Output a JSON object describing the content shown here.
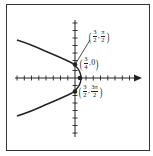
{
  "figure": {
    "equation_implied": "r = 3/(2 + 2cos θ)",
    "axes": {
      "horizontal_arrow": true,
      "tick_count_left": 8,
      "tick_count_right": 7,
      "tick_count_up": 6,
      "tick_count_down": 6
    },
    "points": [
      {
        "id": "p1",
        "r_num": "3",
        "r_den": "2",
        "theta_num": "π",
        "theta_den": "2",
        "label": "(3/2, π/2)"
      },
      {
        "id": "vertex",
        "r_num": "3",
        "r_den": "4",
        "theta": "0",
        "label": "(3/4, 0)"
      },
      {
        "id": "p3",
        "r_num": "3",
        "r_den": "2",
        "theta_num": "3π",
        "theta_den": "2",
        "label": "(3/2, 3π/2)"
      }
    ],
    "colors": {
      "curve": "#222222",
      "axes": "#222222",
      "frame": "#333333",
      "background": "#ffffff"
    }
  }
}
